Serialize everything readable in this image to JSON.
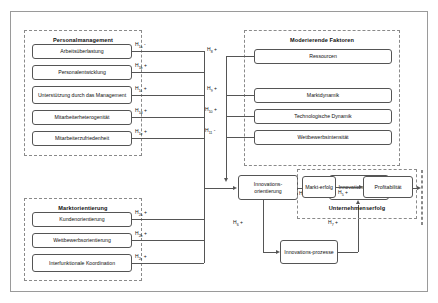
{
  "diagram": {
    "groups": {
      "personalmanagement": {
        "title": "Personalmanagement",
        "items": [
          {
            "label": "Arbeitsüberlastung",
            "hypothesis": "H",
            "sub": "1a",
            "sign": "-"
          },
          {
            "label": "Personalentwicklung",
            "hypothesis": "H",
            "sub": "1b",
            "sign": "+"
          },
          {
            "label": "Unterstützung durch das Management",
            "hypothesis": "H",
            "sub": "1c",
            "sign": "+"
          },
          {
            "label": "Mitarbeiterheterogenität",
            "hypothesis": "H",
            "sub": "1d",
            "sign": "+"
          },
          {
            "label": "Mitarbeiterzufriedenheit",
            "hypothesis": "H",
            "sub": "1e",
            "sign": "+"
          }
        ]
      },
      "marktorientierung": {
        "title": "Marktorientierung",
        "items": [
          {
            "label": "Kundenorientierung",
            "hypothesis": "H",
            "sub": "2a",
            "sign": "+"
          },
          {
            "label": "Wettbewerbsorientierung",
            "hypothesis": "H",
            "sub": "2b",
            "sign": "+"
          },
          {
            "label": "Interfunktionale Koordination",
            "hypothesis": "H",
            "sub": "2c",
            "sign": "+"
          }
        ]
      },
      "moderierende_faktoren": {
        "title": "Moderierende Faktoren",
        "endogen_label": "Endogen:",
        "exogen_label": "Exogen:",
        "endogen_items": [
          {
            "label": "Ressourcen",
            "hypothesis": "H",
            "sub": "8",
            "sign": "+"
          }
        ],
        "exogen_items": [
          {
            "label": "Marktdynamik",
            "hypothesis": "H",
            "sub": "9",
            "sign": "+"
          },
          {
            "label": "Technologische Dynamik",
            "hypothesis": "H",
            "sub": "10",
            "sign": "+"
          },
          {
            "label": "Wettbewerbsintensität",
            "hypothesis": "H",
            "sub": "11",
            "sign": "-"
          }
        ]
      },
      "unternehmenserfolg": {
        "title": "Unternehmenserfolg",
        "items": [
          {
            "label": "Markt-erfolg"
          },
          {
            "label": "Profitabilität"
          }
        ]
      }
    },
    "core": {
      "innovationsorientierung": "Innovations-orientierung",
      "innovationserfolg": "Innovations-erfolg",
      "innovationsprozesse": "Innovations-prozesse"
    },
    "core_hypotheses": [
      {
        "hypothesis": "H",
        "sub": "3",
        "sign": "+",
        "from": "innovationsorientierung",
        "to": "innovationserfolg"
      },
      {
        "hypothesis": "H",
        "sub": "4",
        "sign": "+",
        "from": "innovationserfolg",
        "to": "markterfolg"
      },
      {
        "hypothesis": "H",
        "sub": "5",
        "sign": "+",
        "from": "markterfolg",
        "to": "profitabilitaet"
      },
      {
        "hypothesis": "H",
        "sub": "6",
        "sign": "+",
        "from": "innovationsorientierung",
        "to": "innovationsprozesse"
      },
      {
        "hypothesis": "H",
        "sub": "7",
        "sign": "+",
        "from": "innovationsprozesse",
        "to": "innovationserfolg"
      }
    ],
    "colors": {
      "frame": "#9a9a9a",
      "panel_border": "#8a8a8a",
      "box_border": "#555555",
      "line": "#555555",
      "text": "#111111",
      "background": "#ffffff"
    }
  }
}
